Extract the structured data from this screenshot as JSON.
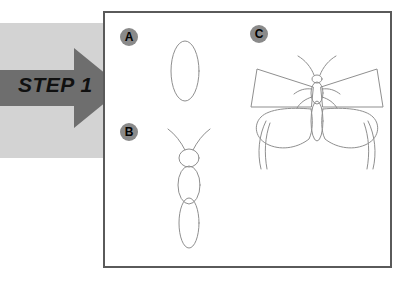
{
  "page": {
    "title": "STEP 1",
    "kind": "drawing-tutorial-step"
  },
  "step_banner": {
    "label": "STEP 1",
    "arrow_icon": "right-arrow-icon",
    "arrow_color": "#6e6e6e",
    "band_color": "#d3d3d3",
    "text_color": "#101010"
  },
  "panel": {
    "border_color": "#5a5a5a",
    "background_color": "#ffffff"
  },
  "markers": [
    {
      "id": "a",
      "label": "A",
      "circle_color": "#8a8a8a",
      "text_color": "#000000"
    },
    {
      "id": "b",
      "label": "B",
      "circle_color": "#8a8a8a",
      "text_color": "#000000"
    },
    {
      "id": "c",
      "label": "C",
      "circle_color": "#8a8a8a",
      "text_color": "#000000"
    }
  ],
  "figures": {
    "a": {
      "name": "wing-oval-sketch",
      "description": "vertical ellipse outline",
      "line_color": "#8f8f8f"
    },
    "b": {
      "name": "butterfly-body-sketch",
      "description": "antennae, head circle, thorax oval, abdomen oval",
      "line_color": "#8f8f8f"
    },
    "c": {
      "name": "butterfly-full-sketch",
      "description": "butterfly with angular forewings, rounded hindwings with tails, body and antennae",
      "line_color": "#8f8f8f"
    }
  }
}
